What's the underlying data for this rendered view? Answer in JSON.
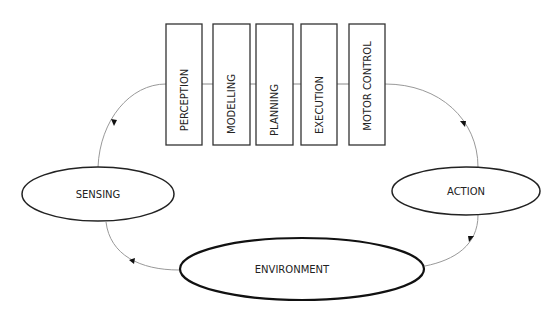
{
  "diagram": {
    "pipeline": [
      {
        "label": "PERCEPTION"
      },
      {
        "label": "MODELLING"
      },
      {
        "label": "PLANNING"
      },
      {
        "label": "EXECUTION"
      },
      {
        "label": "MOTOR CONTROL"
      }
    ],
    "nodes": {
      "sensing": "SENSING",
      "action": "ACTION",
      "environment": "ENVIRONMENT"
    },
    "colors": {
      "stroke": "#222222",
      "connector": "#888888",
      "background": "#ffffff"
    }
  }
}
